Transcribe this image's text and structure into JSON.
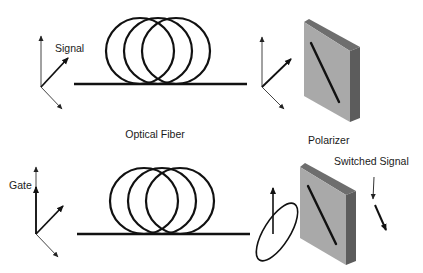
{
  "diagram": {
    "labels": {
      "signal": "Signal",
      "gate": "Gate",
      "optical_fiber": "Optical Fiber",
      "polarizer": "Polarizer",
      "switched_signal": "Switched Signal"
    },
    "colors": {
      "stroke": "#111111",
      "axis_thin": "#444444",
      "polarizer_front": "#a9a9a9",
      "polarizer_top": "#6e6e6e",
      "polarizer_side": "#5c5c5c"
    },
    "rows": [
      {
        "name": "signal-path",
        "input_label": "Signal",
        "fiber_loops": 3,
        "output": "linear-polarization-passes"
      },
      {
        "name": "gate-path",
        "input_label": "Gate",
        "fiber_loops": 3,
        "output": "elliptical-polarization-switched"
      }
    ]
  }
}
